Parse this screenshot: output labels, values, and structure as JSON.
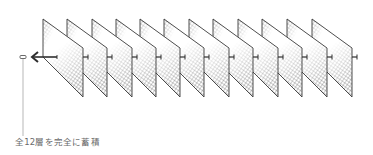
{
  "diagram": {
    "caption": "全12層を完全に蓄積",
    "layer_count": 12,
    "layers": [
      {
        "index": 1,
        "x": 43
      },
      {
        "index": 2,
        "x": 67
      },
      {
        "index": 3,
        "x": 92
      },
      {
        "index": 4,
        "x": 116
      },
      {
        "index": 5,
        "x": 140
      },
      {
        "index": 6,
        "x": 164
      },
      {
        "index": 7,
        "x": 189
      },
      {
        "index": 8,
        "x": 213
      },
      {
        "index": 9,
        "x": 238
      },
      {
        "index": 10,
        "x": 262
      },
      {
        "index": 11,
        "x": 287
      },
      {
        "index": 12,
        "x": 312
      }
    ],
    "icons": {
      "arrow": "left-arrow-icon",
      "panel": "hatched-layer-panel",
      "connector": "skip-connector",
      "marker": "accumulator-marker"
    },
    "colors": {
      "line": "#3a3a3a",
      "hatch": "#555555",
      "caption": "#6a6a6a",
      "background": "#ffffff"
    }
  }
}
